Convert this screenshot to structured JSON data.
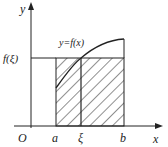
{
  "diagram": {
    "type": "mean-value-theorem-for-integrals",
    "labels": {
      "y_axis": "y",
      "x_axis": "x",
      "origin": "O",
      "a": "a",
      "xi": "ξ",
      "b": "b",
      "f_xi": "f(ξ)",
      "curve": "y=f(x)"
    },
    "colors": {
      "line": "#222222",
      "background": "#ffffff"
    }
  }
}
